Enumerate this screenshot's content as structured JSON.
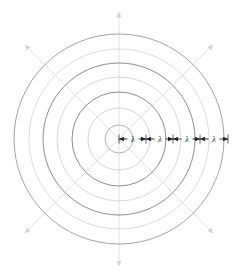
{
  "figure": {
    "type": "wavefront-diagram",
    "background_color": "#ffffff",
    "center": {
      "x": 119,
      "y": 139
    },
    "source_label": "",
    "wavefronts": {
      "count": 7,
      "radii": [
        14,
        31,
        47,
        62,
        76,
        90,
        105
      ],
      "colors": [
        "#9a9a9a",
        "#bfbfbf",
        "#6e6e6e",
        "#c4c4c4",
        "#6e6e6e",
        "#c9c9c9",
        "#8a8a8a"
      ],
      "stroke_widths": [
        0.8,
        0.7,
        0.8,
        0.7,
        0.8,
        0.7,
        0.8
      ]
    },
    "rays": {
      "color": "#d8d8d8",
      "stroke_width": 0.8,
      "directions": [
        {
          "name": "ray-up",
          "angle_deg": 270,
          "length": 127
        },
        {
          "name": "ray-down",
          "angle_deg": 90,
          "length": 127
        },
        {
          "name": "ray-upper-left",
          "angle_deg": 225,
          "length": 133
        },
        {
          "name": "ray-upper-right",
          "angle_deg": 315,
          "length": 133
        },
        {
          "name": "ray-lower-left",
          "angle_deg": 135,
          "length": 133
        },
        {
          "name": "ray-lower-right",
          "angle_deg": 45,
          "length": 133
        }
      ]
    },
    "measurement_axis": {
      "name": "wavelength-axis",
      "color": "#1e1e1e",
      "stroke_width": 0.9,
      "direction": "horizontal-right",
      "start_x": 119,
      "end_x": 228,
      "y": 139,
      "segments": [
        {
          "label": "λ",
          "from_x": 119,
          "to_x": 146,
          "label_x": 133
        },
        {
          "label": "λ",
          "from_x": 146,
          "to_x": 173,
          "label_x": 160
        },
        {
          "label": "λ",
          "from_x": 173,
          "to_x": 200,
          "label_x": 187
        },
        {
          "label": "λ",
          "from_x": 200,
          "to_x": 228,
          "label_x": 214
        }
      ]
    },
    "symbols": {
      "wavelength": "λ"
    }
  }
}
